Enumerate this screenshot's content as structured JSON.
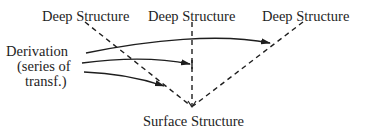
{
  "diagram": {
    "deep_structures": [
      {
        "label": "Deep Structure"
      },
      {
        "label": "Deep Structure"
      },
      {
        "label": "Deep Structure"
      }
    ],
    "derivation": {
      "lines": [
        "Derivation",
        "(series of",
        "transf.)"
      ]
    },
    "surface_structure": {
      "label": "Surface Structure"
    },
    "edges": [
      {
        "from": "Deep Structure 1",
        "to": "Surface Structure",
        "style": "dashed"
      },
      {
        "from": "Deep Structure 2",
        "to": "Surface Structure",
        "style": "dashed"
      },
      {
        "from": "Deep Structure 3",
        "to": "Surface Structure",
        "style": "dashed"
      },
      {
        "from": "Derivation",
        "to": "Deep-Surface path 3",
        "style": "solid-arrow"
      },
      {
        "from": "Derivation",
        "to": "Deep-Surface path 2",
        "style": "solid-arrow"
      },
      {
        "from": "Derivation",
        "to": "Deep-Surface path 1",
        "style": "solid-arrow"
      }
    ],
    "colors": {
      "ink": "#1e1e1e",
      "background": "#ffffff"
    }
  }
}
